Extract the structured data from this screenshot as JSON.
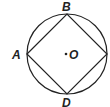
{
  "diagram": {
    "type": "geometry",
    "circle": {
      "center_label": "O",
      "cx": 67,
      "cy": 54,
      "r": 40
    },
    "points": [
      {
        "label": "A",
        "x": 27,
        "y": 54
      },
      {
        "label": "B",
        "x": 67,
        "y": 14
      },
      {
        "label": "",
        "x": 107,
        "y": 54
      },
      {
        "label": "D",
        "x": 67,
        "y": 94
      }
    ],
    "labels": {
      "A": "A",
      "B": "B",
      "D": "D",
      "O": "O"
    },
    "stroke_color": "#222222"
  }
}
